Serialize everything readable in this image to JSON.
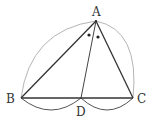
{
  "diagram": {
    "type": "geometry",
    "points": {
      "A": {
        "label": "A",
        "x": 96,
        "y": 21
      },
      "B": {
        "label": "B",
        "x": 21,
        "y": 98
      },
      "C": {
        "label": "C",
        "x": 133,
        "y": 98
      },
      "D": {
        "label": "D",
        "x": 81,
        "y": 98
      }
    },
    "segments": [
      "AB",
      "AC",
      "AD",
      "BC"
    ],
    "arcs": [
      "BA (gray)",
      "AC (gray)",
      "BD (below)",
      "DC (below)"
    ],
    "angle_marks": "two equal-angle dots at A (BAD = DAC)",
    "colors": {
      "line": "#333333",
      "arc_outer": "#b5b5b5",
      "arc_inner": "#555555"
    }
  }
}
